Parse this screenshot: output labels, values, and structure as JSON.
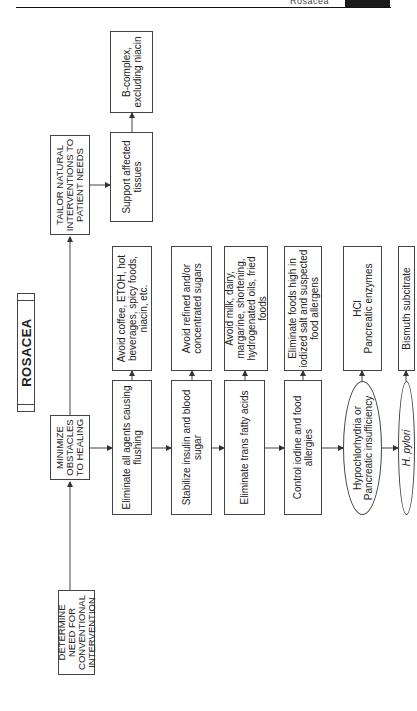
{
  "header": {
    "running_title": "Rosacea"
  },
  "title": "ROSACEA",
  "main_steps": [
    {
      "id": "determine",
      "label": "DETERMINE NEED FOR CONVENTIONAL INTERVENTION"
    },
    {
      "id": "minimize",
      "label": "MINIMIZE OBSTACLES TO HEALING"
    },
    {
      "id": "tailor",
      "label": "TAILOR NATURAL INTERVENTIONS TO PATIENT NEEDS"
    }
  ],
  "obstacles": [
    {
      "id": "flushing",
      "label": "Eliminate all agents causing flushing",
      "detail": "Avoid coffee, ETOH, hot beverages, spicy foods, niacin, etc."
    },
    {
      "id": "insulin",
      "label": "Stabilize insulin and blood sugar",
      "detail": "Avoid refined and/or concentrated sugars"
    },
    {
      "id": "trans",
      "label": "Eliminate trans fatty acids",
      "detail": "Avoid milk, dairy, margarine, shortening, hydrogenated oils, fried foods"
    },
    {
      "id": "iodine",
      "label": "Control iodine and food allergies",
      "detail": "Eliminate foods high in iodized salt and suspected food allergens"
    },
    {
      "id": "hypo",
      "label": "Hypochlorhydria or Pancreatic insufficiency",
      "detail_line1": "HCl",
      "detail_line2": "Pancreatic enzymes",
      "shape": "oval"
    },
    {
      "id": "hpylori",
      "label": "H. pylori",
      "detail": "Bismuth subcitrate",
      "shape": "oval"
    }
  ],
  "tailor_steps": [
    {
      "id": "support",
      "label": "Support affected tissues",
      "detail": "B-complex, excluding niacin"
    }
  ]
}
